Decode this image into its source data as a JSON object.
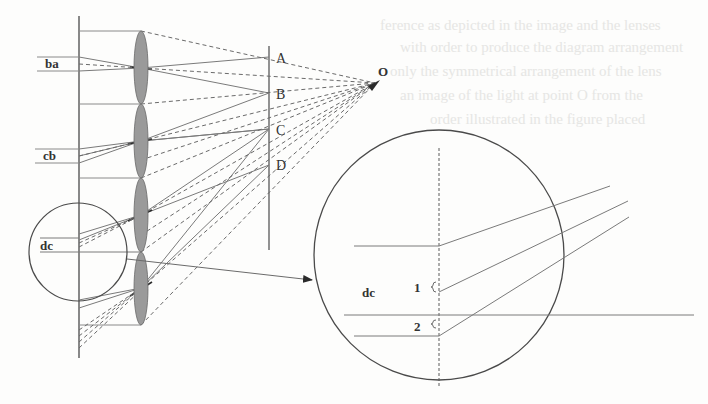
{
  "figure": {
    "colors": {
      "line": "#7a7a7a",
      "dark_line": "#4a4a4a",
      "lens_fill": "#9a9a9a",
      "background": "#fdfdfc"
    },
    "labels": {
      "A": "A",
      "B": "B",
      "C": "C",
      "D": "D",
      "O": "O",
      "ba": "ba",
      "cb": "cb",
      "dc": "dc",
      "inset_dc": "dc",
      "one": "1",
      "two": "2"
    },
    "lenses": [
      {
        "cx": 141,
        "top": 31,
        "bottom": 104
      },
      {
        "cx": 141,
        "top": 104,
        "bottom": 178
      },
      {
        "cx": 141,
        "top": 178,
        "bottom": 252
      },
      {
        "cx": 141,
        "top": 252,
        "bottom": 325
      }
    ],
    "image_plane_points": {
      "A": [
        269,
        57
      ],
      "B": [
        269,
        93
      ],
      "C": [
        269,
        129
      ],
      "D": [
        269,
        165
      ]
    },
    "focal_point_O": [
      375,
      83
    ],
    "small_circle": {
      "cx": 78,
      "cy": 252,
      "r": 49
    },
    "inset_circle": {
      "cx": 439,
      "cy": 255,
      "r": 125
    }
  }
}
